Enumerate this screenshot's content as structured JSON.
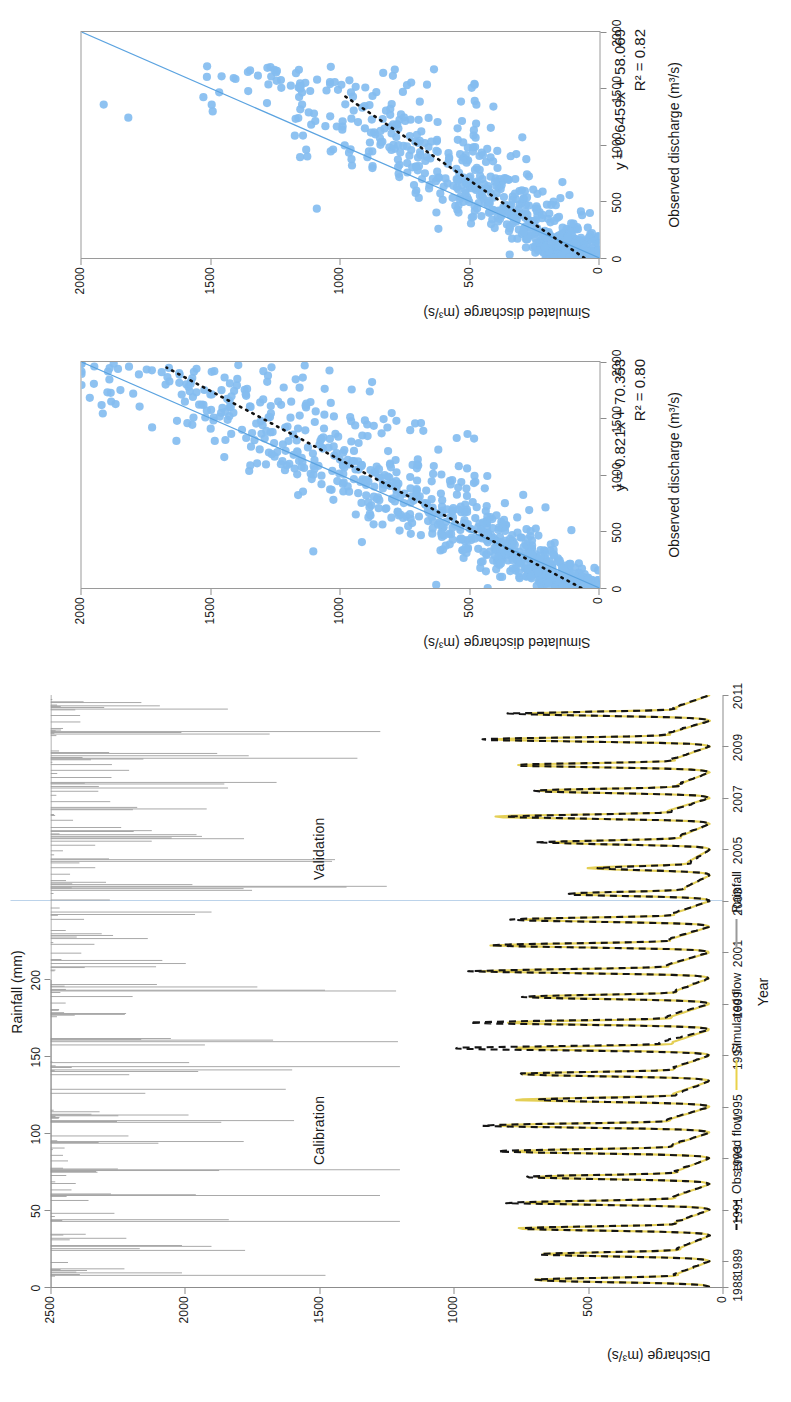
{
  "figure": {
    "orientation": "rotated-90-ccw",
    "panels": [
      "hydrograph-time-series",
      "scatter-calibration",
      "scatter-validation"
    ]
  },
  "timeseries": {
    "rainfall_axis": {
      "title": "Rainfall (mm)",
      "ticks": [
        "0",
        "50",
        "100",
        "150",
        "200"
      ],
      "min": 0,
      "max": 200
    },
    "discharge_axis": {
      "title": "Discharge (m³/s)",
      "ticks": [
        "0",
        "500",
        "1000",
        "1500",
        "2000",
        "2500"
      ],
      "min": 0,
      "max": 2500
    },
    "x_axis": {
      "title": "Year",
      "ticks": [
        "1988",
        "1989",
        "1991",
        "1993",
        "1995",
        "1997",
        "1999",
        "2001",
        "2003",
        "2005",
        "2007",
        "2009",
        "2011"
      ],
      "min": 1988,
      "max": 2011
    },
    "period_labels": {
      "calibration": "Calibration",
      "validation": "Validation",
      "split_year": "2003"
    },
    "legend": [
      {
        "label": "Observed flow",
        "key": "dashed-black-line",
        "color": "#111111"
      },
      {
        "label": "Simulated flow",
        "key": "solid-yellow-line",
        "color": "#e9d24a"
      },
      {
        "label": "Rainfall",
        "key": "solid-grey-line",
        "color": "#9a9a9a"
      }
    ]
  },
  "scatter_calibration": {
    "xlabel": "Observed discharge (m³/s)",
    "ylabel": "Simulated discharge (m³/s)",
    "xticks": [
      "0",
      "500",
      "1000",
      "1500",
      "2000"
    ],
    "yticks": [
      "0",
      "500",
      "1000",
      "1500",
      "2000"
    ],
    "equation": "y = 0.821x + 70.353",
    "r2": "R² = 0.80",
    "point_color": "#84bdf0",
    "oneone_color": "#5ba3e0",
    "fit_color": "#111111"
  },
  "scatter_validation": {
    "xlabel": "Observed discharge (m³/s)",
    "ylabel": "Simulated discharge (m³/s)",
    "xticks": [
      "0",
      "500",
      "1000",
      "1500",
      "2000"
    ],
    "yticks": [
      "0",
      "500",
      "1000",
      "1500",
      "2000"
    ],
    "equation": "y = 0.6459x + 58.069",
    "r2": "R² = 0.82",
    "point_color": "#84bdf0",
    "oneone_color": "#5ba3e0",
    "fit_color": "#111111"
  },
  "chart_data": [
    {
      "type": "line",
      "id": "hydrograph",
      "title": "",
      "xlabel": "Year",
      "ylabel": "Discharge (m³/s)",
      "y2label": "Rainfall (mm)",
      "xlim": [
        1988,
        2011
      ],
      "ylim": [
        0,
        2500
      ],
      "y2lim": [
        0,
        200
      ],
      "grid": false,
      "legend": [
        "Observed flow",
        "Simulated flow",
        "Rainfall"
      ],
      "annotations": [
        "Calibration",
        "Validation"
      ],
      "x": [
        1988,
        1988.5,
        1989,
        1989.5,
        1990,
        1990.5,
        1991,
        1991.5,
        1992,
        1992.5,
        1993,
        1993.5,
        1994,
        1994.5,
        1995,
        1995.5,
        1996,
        1996.5,
        1997,
        1997.5,
        1998,
        1998.5,
        1999,
        1999.5,
        2000,
        2000.5,
        2001,
        2001.5,
        2002,
        2002.5,
        2003,
        2003.5,
        2004,
        2004.5,
        2005,
        2005.5,
        2006,
        2006.5,
        2007,
        2007.5,
        2008,
        2008.5,
        2009,
        2009.5,
        2010,
        2010.5,
        2011
      ],
      "series": [
        {
          "name": "Observed flow",
          "values": [
            60,
            1150,
            70,
            1080,
            60,
            1200,
            55,
            1250,
            60,
            1150,
            65,
            1320,
            60,
            1420,
            58,
            1100,
            62,
            1250,
            55,
            1660,
            60,
            1500,
            58,
            1180,
            62,
            1450,
            60,
            1400,
            58,
            1260,
            60,
            900,
            55,
            700,
            50,
            1050,
            52,
            1300,
            55,
            1120,
            58,
            1260,
            60,
            1420,
            56,
            1200,
            55
          ]
        },
        {
          "name": "Simulated flow",
          "values": [
            55,
            1100,
            62,
            1020,
            55,
            1150,
            50,
            1180,
            55,
            1100,
            58,
            1260,
            55,
            1350,
            52,
            1220,
            58,
            1210,
            50,
            1250,
            55,
            1280,
            52,
            1130,
            58,
            1380,
            55,
            1330,
            52,
            1200,
            55,
            860,
            50,
            760,
            48,
            1000,
            50,
            1380,
            52,
            1080,
            55,
            1200,
            56,
            1360,
            52,
            1150,
            52
          ]
        },
        {
          "name": "Rainfall",
          "note": "daily bars plotted downward from top axis, 0-200 mm, typical peaks 40-180 mm during monsoon months",
          "values": [
            5,
            150,
            8,
            130,
            6,
            160,
            5,
            170,
            7,
            145,
            6,
            175,
            5,
            185,
            6,
            140,
            5,
            160,
            6,
            190,
            5,
            170,
            6,
            150,
            7,
            180,
            5,
            175,
            6,
            155,
            5,
            120,
            5,
            100,
            4,
            135,
            5,
            165,
            6,
            145,
            5,
            160,
            6,
            180,
            5,
            150,
            5
          ]
        }
      ]
    },
    {
      "type": "scatter",
      "id": "scatter-calibration",
      "xlabel": "Observed discharge (m³/s)",
      "ylabel": "Simulated discharge (m³/s)",
      "xlim": [
        0,
        2000
      ],
      "ylim": [
        0,
        2000
      ],
      "xticks": [
        0,
        500,
        1000,
        1500,
        2000
      ],
      "yticks": [
        0,
        500,
        1000,
        1500,
        2000
      ],
      "fit": {
        "slope": 0.821,
        "intercept": 70.353,
        "r2": 0.8,
        "equation": "y = 0.821x + 70.353"
      },
      "reference_line": "1:1",
      "n_points_approx": 900,
      "cluster": "dense cloud 0-1000 on both axes, scattered outliers up to 1900"
    },
    {
      "type": "scatter",
      "id": "scatter-validation",
      "xlabel": "Observed discharge (m³/s)",
      "ylabel": "Simulated discharge (m³/s)",
      "xlim": [
        0,
        2000
      ],
      "ylim": [
        0,
        2000
      ],
      "xticks": [
        0,
        500,
        1000,
        1500,
        2000
      ],
      "yticks": [
        0,
        500,
        1000,
        1500,
        2000
      ],
      "fit": {
        "slope": 0.6459,
        "intercept": 58.069,
        "r2": 0.82,
        "equation": "y = 0.6459x + 58.069"
      },
      "reference_line": "1:1",
      "n_points_approx": 700,
      "cluster": "dense cloud 0-900 on both axes, outliers up to 1500"
    }
  ]
}
